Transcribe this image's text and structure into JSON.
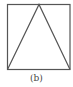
{
  "figure": {
    "caption": "(b)",
    "shapes": {
      "square": {
        "x": 7,
        "y": 4,
        "width": 63,
        "height": 65
      },
      "triangle": {
        "apex": [
          39,
          4
        ],
        "base_left": [
          7,
          69
        ],
        "base_right": [
          70,
          69
        ]
      }
    },
    "stroke_color": "#555555"
  }
}
